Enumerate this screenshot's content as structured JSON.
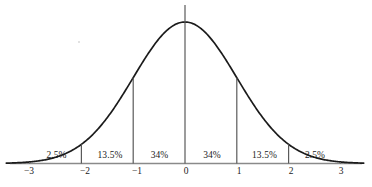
{
  "figure": {
    "background_color": "#ffffff",
    "curve_color": "#1b1b1b",
    "axis_color": "#8a8a8a",
    "divider_color": "#5a5a5a",
    "text_color": "#1b1b1b"
  },
  "chart_data": {
    "type": "area",
    "title": "",
    "subtitle": "",
    "xlabel": "",
    "ylabel": "",
    "xlim": [
      -3.6,
      3.6
    ],
    "ylim": [
      0,
      1.08
    ],
    "grid": false,
    "legend": null,
    "distribution": {
      "name": "standard normal",
      "mean": 0,
      "std_dev": 1,
      "curve_formula": "y = exp(-x^2 / 2)"
    },
    "x_ticks": [
      -3,
      -2,
      -1,
      0,
      1,
      2,
      3
    ],
    "x_tick_labels": [
      "−3",
      "−2",
      "−1",
      "0",
      "1",
      "2",
      "3"
    ],
    "y_ticks": [],
    "y_tick_labels": [],
    "dividers_at_x": [
      -3,
      -2,
      -1,
      0,
      1,
      2,
      3
    ],
    "regions": [
      {
        "label": "2.5%",
        "value": 2.5,
        "x_start": -3,
        "x_end": -2,
        "center_x": -2.5
      },
      {
        "label": "13.5%",
        "value": 13.5,
        "x_start": -2,
        "x_end": -1,
        "center_x": -1.5
      },
      {
        "label": "34%",
        "value": 34,
        "x_start": -1,
        "x_end": 0,
        "center_x": -0.5
      },
      {
        "label": "34%",
        "value": 34,
        "x_start": 0,
        "x_end": 1,
        "center_x": 0.5
      },
      {
        "label": "13.5%",
        "value": 13.5,
        "x_start": 1,
        "x_end": 2,
        "center_x": 1.5
      },
      {
        "label": "2.5%",
        "value": 2.5,
        "x_start": 2,
        "x_end": 3,
        "center_x": 2.5
      }
    ]
  }
}
